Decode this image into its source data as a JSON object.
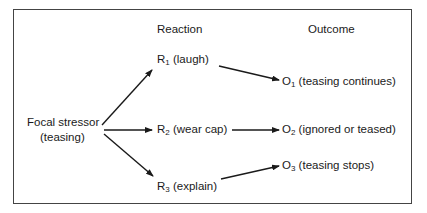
{
  "headers": {
    "reaction": "Reaction",
    "outcome": "Outcome"
  },
  "stressor": {
    "line1": "Focal stressor",
    "line2": "(teasing)"
  },
  "reactions": [
    {
      "letter": "R",
      "sub": "1",
      "label": " (laugh)"
    },
    {
      "letter": "R",
      "sub": "2",
      "label": " (wear cap)"
    },
    {
      "letter": "R",
      "sub": "3",
      "label": " (explain)"
    }
  ],
  "outcomes": [
    {
      "letter": "O",
      "sub": "1",
      "label": " (teasing continues)"
    },
    {
      "letter": "O",
      "sub": "2",
      "label": " (ignored or teased)"
    },
    {
      "letter": "O",
      "sub": "3",
      "label": " (teasing stops)"
    }
  ],
  "edges": [
    {
      "from": "Focal stressor",
      "to": "R1"
    },
    {
      "from": "Focal stressor",
      "to": "R2"
    },
    {
      "from": "Focal stressor",
      "to": "R3"
    },
    {
      "from": "R1",
      "to": "O1"
    },
    {
      "from": "R2",
      "to": "O2"
    },
    {
      "from": "R3",
      "to": "O3"
    }
  ]
}
